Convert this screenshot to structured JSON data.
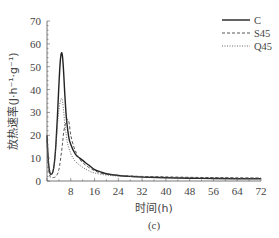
{
  "chart_data": {
    "type": "line",
    "title": "",
    "xlabel": "时间(h)",
    "ylabel": "放热速率(J·h⁻¹·g⁻¹)",
    "caption": "(c)",
    "xlim": [
      0,
      72
    ],
    "ylim": [
      0,
      70
    ],
    "xticks": [
      8,
      16,
      24,
      32,
      40,
      48,
      56,
      64,
      72
    ],
    "yticks": [
      0,
      10,
      20,
      30,
      40,
      50,
      60,
      70
    ],
    "grid": false,
    "legend_position": "upper right",
    "series": [
      {
        "name": "C",
        "style": "solid",
        "x": [
          0,
          0.5,
          1,
          1.5,
          2,
          2.5,
          3,
          3.5,
          4,
          4.5,
          5,
          5.5,
          6,
          6.5,
          7,
          7.5,
          8,
          9,
          10,
          11,
          12,
          13,
          14,
          16,
          18,
          20,
          24,
          28,
          32,
          40,
          48,
          56,
          64,
          72
        ],
        "y": [
          20,
          8,
          3.5,
          3,
          4,
          8,
          16,
          28,
          42,
          53,
          56,
          50,
          38,
          28,
          22,
          18,
          16,
          13,
          11,
          10,
          9,
          8,
          7,
          5,
          4,
          3.2,
          2.4,
          2,
          1.7,
          1.4,
          1.2,
          1.1,
          1,
          1
        ]
      },
      {
        "name": "S45",
        "style": "dashed",
        "x": [
          0,
          0.5,
          1,
          1.5,
          2,
          3,
          4,
          5,
          5.5,
          6,
          6.5,
          7,
          7.5,
          8,
          9,
          10,
          11,
          12,
          14,
          16,
          18,
          20,
          24,
          28,
          32,
          40,
          48,
          56,
          64,
          72
        ],
        "y": [
          18,
          6,
          2,
          1.5,
          1.5,
          2,
          5,
          14,
          20,
          24,
          26,
          27,
          25,
          20,
          15,
          12,
          9.5,
          8,
          6,
          4.5,
          3.5,
          3,
          2.5,
          2.2,
          2,
          1.8,
          1.6,
          1.5,
          1.4,
          1.3
        ]
      },
      {
        "name": "Q45",
        "style": "dotted",
        "x": [
          0,
          0.5,
          1,
          1.5,
          2,
          2.5,
          3,
          3.5,
          4,
          4.5,
          5,
          5.5,
          6,
          6.5,
          7,
          8,
          9,
          10,
          12,
          14,
          16,
          20,
          24,
          32,
          40,
          48,
          56,
          64,
          72
        ],
        "y": [
          18,
          7,
          3,
          3,
          4,
          8,
          15,
          24,
          31,
          35,
          36,
          32,
          25,
          20,
          16,
          12,
          9.5,
          8,
          6,
          4.5,
          3.5,
          2.6,
          2.2,
          1.8,
          1.6,
          1.4,
          1.3,
          1.2,
          1.2
        ]
      }
    ]
  },
  "legend": {
    "items": [
      {
        "label": "C",
        "style": "solid"
      },
      {
        "label": "S45",
        "style": "dashed"
      },
      {
        "label": "Q45",
        "style": "dotted"
      }
    ]
  },
  "colors": {
    "line": "#222222",
    "axis": "#555555",
    "text": "#444444"
  }
}
